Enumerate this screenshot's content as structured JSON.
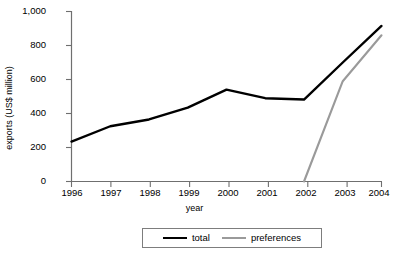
{
  "chart_data": {
    "type": "line",
    "title": "",
    "xlabel": "year",
    "ylabel": "exports (US$ million)",
    "categories": [
      "1996",
      "1997",
      "1998",
      "1999",
      "2000",
      "2001",
      "2002",
      "2003",
      "2004"
    ],
    "x": [
      1996,
      1997,
      1998,
      1999,
      2000,
      2001,
      2002,
      2003,
      2004
    ],
    "xlim": [
      1996,
      2004
    ],
    "ylim": [
      0,
      1000
    ],
    "yticks": [
      0,
      200,
      400,
      600,
      800,
      1000
    ],
    "ytick_labels": [
      "0",
      "200",
      "400",
      "600",
      "800",
      "1,000"
    ],
    "xtick_labels": [
      "1996",
      "1997",
      "1998",
      "1999",
      "2000",
      "2001",
      "2002",
      "2003",
      "2004"
    ],
    "grid": false,
    "legend_position": "bottom",
    "series": [
      {
        "name": "total",
        "color": "#000000",
        "values": [
          235,
          325,
          365,
          435,
          540,
          490,
          482,
          700,
          915
        ]
      },
      {
        "name": "preferences",
        "color": "#9a9a9a",
        "values": [
          null,
          null,
          null,
          null,
          null,
          null,
          0,
          590,
          860
        ]
      }
    ]
  },
  "legend": {
    "items": [
      {
        "label": "total",
        "swatch": "line-black"
      },
      {
        "label": "preferences",
        "swatch": "line-gray"
      }
    ]
  },
  "axis": {
    "y_title": "exports (US$ million)",
    "x_title": "year"
  },
  "colors": {
    "total": "#000000",
    "preferences": "#9a9a9a",
    "axis": "#6f6f6f",
    "background": "#ffffff"
  }
}
